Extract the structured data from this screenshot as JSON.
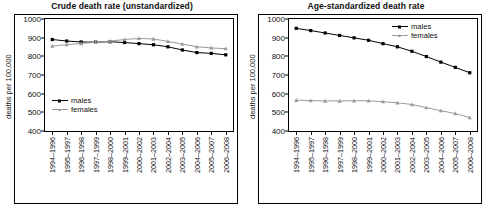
{
  "chart_data": [
    {
      "type": "line",
      "title": "Crude death rate (unstandardized)",
      "xlabel": "",
      "ylabel": "deaths per 100,000",
      "ylim": [
        400,
        1000
      ],
      "yticks": [
        400,
        500,
        600,
        700,
        800,
        900,
        1000
      ],
      "grid": false,
      "legend_position": "center-left",
      "categories": [
        "1994–1996",
        "1995–1997",
        "1996–1998",
        "1997–1999",
        "1998–2000",
        "1999–2001",
        "2000–2002",
        "2001–2003",
        "2002–2004",
        "2003–2005",
        "2004–2006",
        "2005–2007",
        "2006–2008"
      ],
      "series": [
        {
          "name": "males",
          "color": "#000000",
          "marker": "square",
          "values": [
            890,
            882,
            877,
            876,
            878,
            874,
            868,
            862,
            851,
            834,
            820,
            816,
            808
          ]
        },
        {
          "name": "females",
          "color": "#9a9a9a",
          "marker": "triangle",
          "values": [
            855,
            863,
            869,
            875,
            882,
            890,
            896,
            893,
            880,
            866,
            851,
            845,
            841
          ]
        }
      ]
    },
    {
      "type": "line",
      "title": "Age-standardized death rate",
      "xlabel": "",
      "ylabel": "deaths per 100,000",
      "ylim": [
        400,
        1000
      ],
      "yticks": [
        400,
        500,
        600,
        700,
        800,
        900,
        1000
      ],
      "grid": false,
      "legend_position": "top-right",
      "categories": [
        "1994–1996",
        "1995–1997",
        "1996–1998",
        "1997–1999",
        "1998–2000",
        "1999–2001",
        "2000–2002",
        "2001–2003",
        "2002–2004",
        "2003–2005",
        "2004–2006",
        "2005–2007",
        "2006–2008"
      ],
      "series": [
        {
          "name": "males",
          "color": "#000000",
          "marker": "square",
          "values": [
            950,
            938,
            925,
            912,
            899,
            886,
            868,
            851,
            827,
            799,
            769,
            741,
            712
          ]
        },
        {
          "name": "females",
          "color": "#9a9a9a",
          "marker": "triangle",
          "values": [
            565,
            563,
            561,
            561,
            562,
            562,
            557,
            551,
            542,
            525,
            509,
            493,
            472
          ]
        }
      ]
    }
  ]
}
